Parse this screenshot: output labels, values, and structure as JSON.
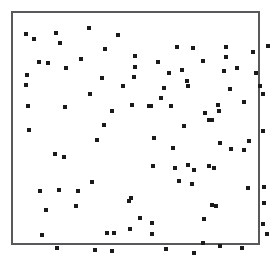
{
  "figure": {
    "width": 273,
    "height": 257,
    "background_color": "#ffffff",
    "frame": {
      "x": 11,
      "y": 11,
      "width": 249,
      "height": 234,
      "border_color": "#59595b",
      "border_width": 2,
      "fill_color": "#ffffff"
    },
    "marker": {
      "shape": "square",
      "size": 4,
      "color": "#1a1a1a"
    }
  },
  "chart_data": {
    "type": "scatter",
    "title": "",
    "subtitle": "",
    "xlabel": "",
    "ylabel": "",
    "grid": false,
    "legend": null,
    "axis_ticks": false,
    "axis_tick_labels": [],
    "xlim": [
      0,
      249
    ],
    "ylim": [
      0,
      234
    ],
    "point_count": 104,
    "marker_shape": "square",
    "marker_color": "#1a1a1a",
    "series": [
      {
        "name": "points",
        "marker": "square",
        "color": "#1a1a1a",
        "points": [
          [
            13,
            21
          ],
          [
            21,
            26
          ],
          [
            43,
            20
          ],
          [
            76,
            15
          ],
          [
            105,
            22
          ],
          [
            26,
            49
          ],
          [
            35,
            50
          ],
          [
            53,
            55
          ],
          [
            122,
            43
          ],
          [
            164,
            34
          ],
          [
            180,
            35
          ],
          [
            213,
            34
          ],
          [
            240,
            39
          ],
          [
            255,
            33
          ],
          [
            213,
            44
          ],
          [
            122,
            54
          ],
          [
            145,
            49
          ],
          [
            190,
            48
          ],
          [
            211,
            58
          ],
          [
            15,
            93
          ],
          [
            52,
            94
          ],
          [
            77,
            81
          ],
          [
            89,
            65
          ],
          [
            121,
            64
          ],
          [
            174,
            68
          ],
          [
            175,
            73
          ],
          [
            151,
            75
          ],
          [
            217,
            76
          ],
          [
            247,
            73
          ],
          [
            250,
            81
          ],
          [
            148,
            85
          ],
          [
            138,
            93
          ],
          [
            158,
            93
          ],
          [
            136,
            93
          ],
          [
            231,
            89
          ],
          [
            205,
            92
          ],
          [
            206,
            98
          ],
          [
            199,
            107
          ],
          [
            99,
            98
          ],
          [
            91,
            112
          ],
          [
            16,
            117
          ],
          [
            141,
            125
          ],
          [
            84,
            127
          ],
          [
            250,
            118
          ],
          [
            236,
            128
          ],
          [
            218,
            136
          ],
          [
            231,
            137
          ],
          [
            42,
            141
          ],
          [
            51,
            144
          ],
          [
            160,
            135
          ],
          [
            140,
            153
          ],
          [
            162,
            155
          ],
          [
            175,
            152
          ],
          [
            181,
            157
          ],
          [
            196,
            153
          ],
          [
            201,
            155
          ],
          [
            166,
            168
          ],
          [
            179,
            171
          ],
          [
            79,
            169
          ],
          [
            27,
            178
          ],
          [
            46,
            177
          ],
          [
            65,
            178
          ],
          [
            118,
            185
          ],
          [
            235,
            175
          ],
          [
            251,
            174
          ],
          [
            33,
            197
          ],
          [
            63,
            193
          ],
          [
            116,
            188
          ],
          [
            199,
            192
          ],
          [
            203,
            193
          ],
          [
            251,
            190
          ],
          [
            127,
            205
          ],
          [
            139,
            210
          ],
          [
            191,
            206
          ],
          [
            117,
            216
          ],
          [
            94,
            220
          ],
          [
            101,
            220
          ],
          [
            139,
            221
          ],
          [
            29,
            222
          ],
          [
            250,
            211
          ],
          [
            254,
            221
          ],
          [
            190,
            230
          ],
          [
            207,
            233
          ],
          [
            229,
            235
          ],
          [
            82,
            237
          ],
          [
            99,
            238
          ],
          [
            44,
            235
          ],
          [
            181,
            240
          ],
          [
            13,
            72
          ],
          [
            14,
            62
          ],
          [
            47,
            30
          ],
          [
            68,
            46
          ],
          [
            92,
            36
          ],
          [
            156,
            60
          ],
          [
            169,
            57
          ],
          [
            224,
            55
          ],
          [
            243,
            60
          ],
          [
            119,
            92
          ],
          [
            110,
            73
          ],
          [
            171,
            113
          ],
          [
            196,
            107
          ],
          [
            192,
            100
          ],
          [
            207,
            130
          ],
          [
            153,
            236
          ]
        ]
      }
    ]
  }
}
